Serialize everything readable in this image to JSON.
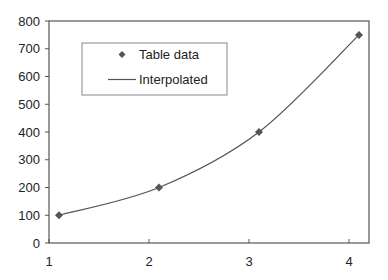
{
  "chart_data": {
    "type": "line",
    "title": "",
    "xlabel": "",
    "ylabel": "",
    "xlim": [
      1,
      4.2
    ],
    "ylim": [
      0,
      800
    ],
    "x_ticks": [
      1,
      2,
      3,
      4
    ],
    "y_ticks": [
      0,
      100,
      200,
      300,
      400,
      500,
      600,
      700,
      800
    ],
    "grid": false,
    "legend_position": "upper-left-inside",
    "series": [
      {
        "name": "Table data",
        "kind": "scatter",
        "marker": "diamond",
        "x": [
          1.1,
          2.1,
          3.1,
          4.1
        ],
        "values": [
          100,
          200,
          400,
          750
        ]
      },
      {
        "name": "Interpolated",
        "kind": "line",
        "x": [
          1.1,
          2.1,
          3.1,
          4.1
        ],
        "values": [
          100,
          200,
          400,
          750
        ]
      }
    ]
  },
  "legend": {
    "items": [
      {
        "label": "Table data",
        "symbol": "diamond"
      },
      {
        "label": "Interpolated",
        "symbol": "line"
      }
    ]
  },
  "colors": {
    "axis": "#555555",
    "series": "#555555",
    "marker": "#555555",
    "text": "#222222"
  }
}
